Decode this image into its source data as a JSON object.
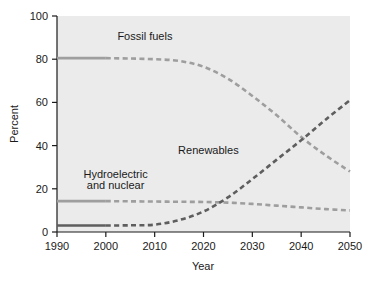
{
  "chart_data": {
    "type": "line",
    "title": "",
    "xlabel": "Year",
    "ylabel": "Percent",
    "xlim": [
      1990,
      2050
    ],
    "ylim": [
      0,
      100
    ],
    "xticks": [
      1990,
      2000,
      2010,
      2020,
      2030,
      2040,
      2050
    ],
    "yticks": [
      0,
      20,
      40,
      60,
      80,
      100
    ],
    "xtick_labels": [
      "1990",
      "2000",
      "2010",
      "2020",
      "2030",
      "2040",
      "2050"
    ],
    "ytick_labels": [
      "0",
      "20",
      "40",
      "60",
      "80",
      "100"
    ],
    "grid": false,
    "legend": "inline-annotations",
    "plot_background": "#ebebeb",
    "x": [
      1990,
      1995,
      2000,
      2005,
      2010,
      2015,
      2020,
      2025,
      2030,
      2035,
      2040,
      2045,
      2050
    ],
    "series": [
      {
        "name": "Fossil fuels",
        "color": "#9e9e9e",
        "solid_until": 2000,
        "label_x": 2008,
        "label_y": 89,
        "values": [
          80.5,
          80.5,
          80.5,
          80.3,
          80.0,
          79.2,
          76.5,
          71.0,
          63.0,
          54.0,
          44.0,
          35.5,
          28.0
        ]
      },
      {
        "name": "Hydroelectric and nuclear",
        "color": "#9e9e9e",
        "solid_until": 2000,
        "label_x": 2002,
        "label_y": 24,
        "label_line1": "Hydroelectric",
        "label_line2": "and nuclear",
        "values": [
          14.3,
          14.3,
          14.3,
          14.2,
          14.1,
          14.0,
          13.9,
          13.6,
          13.0,
          12.2,
          11.4,
          10.6,
          10.0
        ]
      },
      {
        "name": "Renewables",
        "color": "#5e5e5e",
        "solid_until": 2000,
        "label_x": 2020,
        "label_y": 36,
        "values": [
          3.0,
          3.0,
          3.0,
          3.1,
          3.4,
          5.5,
          9.5,
          16.0,
          24.5,
          33.5,
          42.5,
          52.0,
          61.0
        ]
      }
    ],
    "annotations": [
      {
        "text": "Fossil fuels",
        "x": 2008,
        "y": 89
      },
      {
        "text": "Hydroelectric",
        "x": 2002,
        "y": 25
      },
      {
        "text": "and nuclear",
        "x": 2002,
        "y": 20
      },
      {
        "text": "Renewables",
        "x": 2021,
        "y": 36
      }
    ]
  },
  "axes": {
    "x_title": "Year",
    "y_title": "Percent"
  }
}
